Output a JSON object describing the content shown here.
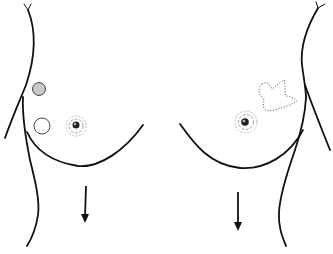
{
  "figure": {
    "title": "Breast illustration with lesion markers",
    "colors": {
      "line": "#111111",
      "filled_marker": "#c8c8c8",
      "dotted_outline": "#555555",
      "background": "#ffffff"
    },
    "left_breast": {
      "markers": [
        {
          "type": "filled-circle",
          "label": "filled circle marker"
        },
        {
          "type": "open-circle",
          "label": "open circle marker"
        }
      ],
      "nipple": "nipple-areola",
      "arrow": "downward arrow"
    },
    "right_breast": {
      "markers": [
        {
          "type": "dotted-irregular-region",
          "label": "dotted irregular outline"
        }
      ],
      "nipple": "nipple-areola",
      "arrow": "downward arrow"
    }
  }
}
